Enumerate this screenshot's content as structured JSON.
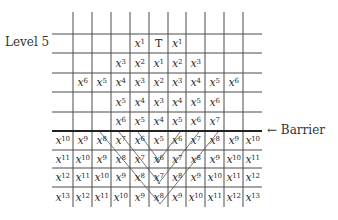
{
  "labels": {
    "level": "Level 5",
    "barrier": "← Barrier"
  },
  "grid": {
    "columns_x": [
      52,
      73,
      92,
      111,
      130,
      149,
      168,
      186,
      205,
      224,
      243,
      262
    ],
    "rows_y": [
      12,
      34,
      53,
      73,
      92,
      112,
      131,
      150,
      168,
      187,
      207
    ],
    "barrier_row_index": 6,
    "rows": [
      {
        "row": 1,
        "cells": [
          null,
          null,
          null,
          null,
          "x^1",
          "T",
          "x^1",
          null,
          null,
          null,
          null
        ]
      },
      {
        "row": 2,
        "cells": [
          null,
          null,
          null,
          "x^3",
          "x^2",
          "x^1",
          "x^2",
          "x^3",
          null,
          null,
          null
        ]
      },
      {
        "row": 3,
        "cells": [
          null,
          "x^6",
          "x^5",
          "x^4",
          "x^3",
          "x^2",
          "x^3",
          "x^4",
          "x^5",
          "x^6",
          null
        ]
      },
      {
        "row": 4,
        "cells": [
          null,
          null,
          null,
          "x^5",
          "x^4",
          "x^3",
          "x^4",
          "x^5",
          "x^6",
          null,
          null
        ]
      },
      {
        "row": 5,
        "cells": [
          null,
          null,
          null,
          "x^6",
          "x^5",
          "x^4",
          "x^5",
          "x^6",
          "x^7",
          null,
          null
        ]
      },
      {
        "row": 6,
        "cells": [
          "x^10",
          "x^9",
          "x^8",
          "x^7",
          "x^6",
          "x^5",
          "x^6",
          "x^7",
          "x^8",
          "x^9",
          "x^10"
        ]
      },
      {
        "row": 7,
        "cells": [
          "x^11",
          "x^10",
          "x^9",
          "x^8",
          "x^7",
          "x^6",
          "x^7",
          "x^8",
          "x^9",
          "x^10",
          "x^11"
        ]
      },
      {
        "row": 8,
        "cells": [
          "x^12",
          "x^11",
          "x^10",
          "x^9",
          "x^8",
          "x^7",
          "x^8",
          "x^9",
          "x^10",
          "x^11",
          "x^12"
        ]
      },
      {
        "row": 9,
        "cells": [
          "x^13",
          "x^12",
          "x^11",
          "x^10",
          "x^9",
          "x^8",
          "x^9",
          "x^10",
          "x^11",
          "x^12",
          "x^13"
        ]
      }
    ]
  },
  "diagonals": [
    {
      "from": [
        100,
        132
      ],
      "to": [
        160,
        204
      ]
    },
    {
      "from": [
        119,
        132
      ],
      "to": [
        160,
        184
      ]
    },
    {
      "from": [
        138,
        132
      ],
      "to": [
        160,
        162
      ]
    },
    {
      "from": [
        158,
        162
      ],
      "to": [
        180,
        132
      ]
    },
    {
      "from": [
        158,
        184
      ],
      "to": [
        199,
        132
      ]
    },
    {
      "from": [
        160,
        204
      ],
      "to": [
        218,
        132
      ]
    }
  ],
  "colors": {
    "line": "#4a4a4a",
    "text": "#2a2a2a",
    "diagonal": "#555555"
  }
}
